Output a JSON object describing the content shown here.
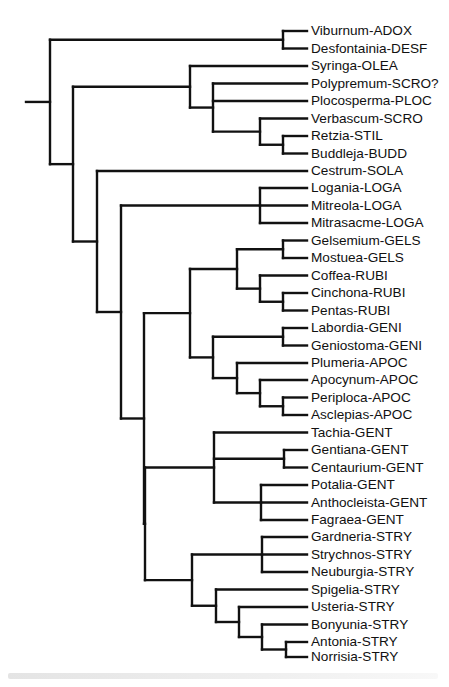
{
  "figure": {
    "type": "phylogenetic-tree",
    "orientation": "left-to-right",
    "line_color": "#111111",
    "background": "#ffffff",
    "tip_x": 307,
    "root_stub": {
      "x1": 26,
      "x2": 50,
      "y": 104
    },
    "caption_visible": "faded, illegible caption line"
  },
  "tips": [
    {
      "label": "Viburnum-ADOX",
      "y": 31
    },
    {
      "label": "Desfontainia-DESF",
      "y": 48.5
    },
    {
      "label": "Syringa-OLEA",
      "y": 66
    },
    {
      "label": "Polypremum-SCRO?",
      "y": 83.5
    },
    {
      "label": "Plocosperma-PLOC",
      "y": 101
    },
    {
      "label": "Verbascum-SCRO",
      "y": 118.5
    },
    {
      "label": "Retzia-STIL",
      "y": 136
    },
    {
      "label": "Buddleja-BUDD",
      "y": 153.5
    },
    {
      "label": "Cestrum-SOLA",
      "y": 171
    },
    {
      "label": "Logania-LOGA",
      "y": 188
    },
    {
      "label": "Mitreola-LOGA",
      "y": 205.5
    },
    {
      "label": "Mitrasacme-LOGA",
      "y": 223
    },
    {
      "label": "Gelsemium-GELS",
      "y": 240.5
    },
    {
      "label": "Mostuea-GELS",
      "y": 258
    },
    {
      "label": "Coffea-RUBI",
      "y": 275.5
    },
    {
      "label": "Cinchona-RUBI",
      "y": 293
    },
    {
      "label": "Pentas-RUBI",
      "y": 310.5
    },
    {
      "label": "Labordia-GENI",
      "y": 328
    },
    {
      "label": "Geniostoma-GENI",
      "y": 345.5
    },
    {
      "label": "Plumeria-APOC",
      "y": 363
    },
    {
      "label": "Apocynum-APOC",
      "y": 380
    },
    {
      "label": "Periploca-APOC",
      "y": 397.5
    },
    {
      "label": "Asclepias-APOC",
      "y": 415
    },
    {
      "label": "Tachia-GENT",
      "y": 432.5
    },
    {
      "label": "Gentiana-GENT",
      "y": 450
    },
    {
      "label": "Centaurium-GENT",
      "y": 467.5
    },
    {
      "label": "Potalia-GENT",
      "y": 485
    },
    {
      "label": "Anthocleista-GENT",
      "y": 502.5
    },
    {
      "label": "Fagraea-GENT",
      "y": 520
    },
    {
      "label": "Gardneria-STRY",
      "y": 537
    },
    {
      "label": "Strychnos-STRY",
      "y": 554.5
    },
    {
      "label": "Neuburgia-STRY",
      "y": 572
    },
    {
      "label": "Spigelia-STRY",
      "y": 589.5
    },
    {
      "label": "Usteria-STRY",
      "y": 607
    },
    {
      "label": "Bonyunia-STRY",
      "y": 624.5
    },
    {
      "label": "Antonia-STRY",
      "y": 642
    },
    {
      "label": "Norrisia-STRY",
      "y": 657
    }
  ],
  "nodes": [
    {
      "id": "root",
      "x": 50,
      "children": [
        "adox_desf",
        "n2"
      ]
    },
    {
      "id": "adox_desf",
      "x": 283,
      "children": [
        "t0",
        "t1"
      ]
    },
    {
      "id": "n2",
      "x": 73,
      "children": [
        "olea_clade",
        "n3"
      ]
    },
    {
      "id": "olea_clade",
      "x": 190,
      "children": [
        "t2",
        "scro_clade"
      ]
    },
    {
      "id": "scro_clade",
      "x": 213,
      "children": [
        "t3",
        "t4",
        "verb_clade"
      ]
    },
    {
      "id": "verb_clade",
      "x": 260,
      "children": [
        "t5",
        "retz_budd"
      ]
    },
    {
      "id": "retz_budd",
      "x": 283,
      "children": [
        "t6",
        "t7"
      ]
    },
    {
      "id": "n3",
      "x": 97,
      "children": [
        "t8",
        "n4"
      ]
    },
    {
      "id": "n4",
      "x": 121,
      "children": [
        "loga",
        "n5"
      ]
    },
    {
      "id": "loga",
      "x": 260,
      "children": [
        "t9",
        "t10",
        "t11"
      ]
    },
    {
      "id": "n5",
      "x": 144,
      "children": [
        "n6",
        "n_gent_stry"
      ]
    },
    {
      "id": "n6",
      "x": 190,
      "children": [
        "gels_rubi",
        "geni_apoc"
      ]
    },
    {
      "id": "gels_rubi",
      "x": 237,
      "children": [
        "gels",
        "rubi"
      ]
    },
    {
      "id": "gels",
      "x": 283,
      "children": [
        "t12",
        "t13"
      ]
    },
    {
      "id": "rubi",
      "x": 260,
      "children": [
        "t14",
        "cinch_pent"
      ]
    },
    {
      "id": "cinch_pent",
      "x": 283,
      "children": [
        "t15",
        "t16"
      ]
    },
    {
      "id": "geni_apoc",
      "x": 213,
      "children": [
        "geni",
        "apoc"
      ]
    },
    {
      "id": "geni",
      "x": 283,
      "children": [
        "t17",
        "t18"
      ]
    },
    {
      "id": "apoc",
      "x": 237,
      "children": [
        "t19",
        "apoc2"
      ]
    },
    {
      "id": "apoc2",
      "x": 260,
      "children": [
        "t20",
        "peri_ascl"
      ]
    },
    {
      "id": "peri_ascl",
      "x": 283,
      "children": [
        "t21",
        "t22"
      ]
    },
    {
      "id": "n_gent_stry",
      "x": 145,
      "children": [
        "gent",
        "stry"
      ]
    },
    {
      "id": "gent",
      "x": 214,
      "children": [
        "t23",
        "gent_cent",
        "pota_clade"
      ]
    },
    {
      "id": "gent_cent",
      "x": 284,
      "children": [
        "t24",
        "t25"
      ]
    },
    {
      "id": "pota_clade",
      "x": 261,
      "children": [
        "t26",
        "t27",
        "t28"
      ]
    },
    {
      "id": "stry",
      "x": 192,
      "children": [
        "gard_clade",
        "spig_clade"
      ]
    },
    {
      "id": "gard_clade",
      "x": 262,
      "children": [
        "t29",
        "t30",
        "t31"
      ]
    },
    {
      "id": "spig_clade",
      "x": 216,
      "children": [
        "t32",
        "ust_clade"
      ]
    },
    {
      "id": "ust_clade",
      "x": 239,
      "children": [
        "t33",
        "bony_clade"
      ]
    },
    {
      "id": "bony_clade",
      "x": 262,
      "children": [
        "t34",
        "ant_norr"
      ]
    },
    {
      "id": "ant_norr",
      "x": 286,
      "children": [
        "t35",
        "t36"
      ]
    }
  ]
}
